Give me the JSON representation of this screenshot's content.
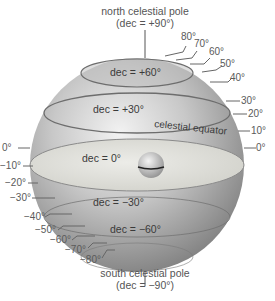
{
  "diagram": {
    "title_top": "north celestial pole",
    "title_top_sub": "(dec = +90°)",
    "title_bottom": "south celestial pole",
    "title_bottom_sub": "(dec = −90°)",
    "circle_labels": {
      "dec_plus60": "dec = +60°",
      "dec_plus30": "dec = +30°",
      "dec_zero": "dec = 0°",
      "dec_minus30": "dec = −30°",
      "dec_minus60": "dec = −60°",
      "celestial_equator": "celestial equator"
    },
    "ticks_right": [
      "80°",
      "70°",
      "60°",
      "50°",
      "40°",
      "30°",
      "20°",
      "10°",
      "0°"
    ],
    "ticks_left": [
      "0°",
      "−10°",
      "−20°",
      "−30°",
      "−40°",
      "−50°",
      "−60°",
      "−70°",
      "−80°"
    ],
    "colors": {
      "sphere_light": "#e4e4e4",
      "sphere_dark": "#8a8a8a",
      "equator_plane": "#d8d8d2",
      "line": "#666666",
      "text": "#555555"
    }
  }
}
